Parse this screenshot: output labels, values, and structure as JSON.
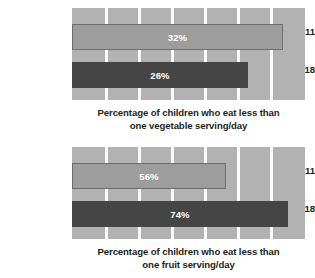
{
  "chart_data": [
    {
      "type": "bar",
      "orientation": "horizontal",
      "title": "",
      "caption_line1": "Percentage of children who eat less than",
      "caption_line2": "one vegetable serving/day",
      "xlabel": "",
      "ylabel": "",
      "categories": [
        "Ages 6–11",
        "Ages 12–18"
      ],
      "values": [
        32,
        26
      ],
      "value_labels": [
        "32%",
        "26%"
      ],
      "bar_pixel_widths": [
        211,
        176
      ],
      "bar_styles": [
        "light",
        "dark"
      ],
      "grid": true,
      "gridline_count": 6,
      "legend": "none"
    },
    {
      "type": "bar",
      "orientation": "horizontal",
      "title": "",
      "caption_line1": "Percentage of children who eat less than",
      "caption_line2": "one fruit serving/day",
      "xlabel": "",
      "ylabel": "",
      "categories": [
        "Ages 6–11",
        "Ages 12–18"
      ],
      "values": [
        56,
        74
      ],
      "value_labels": [
        "56%",
        "74%"
      ],
      "bar_pixel_widths": [
        154,
        216
      ],
      "bar_styles": [
        "light",
        "dark"
      ],
      "grid": true,
      "gridline_count": 6,
      "legend": "none"
    }
  ],
  "colors": {
    "plot_background": "#b2b2b2",
    "gridline": "#fbfbfb",
    "bar_light": "#9d9d9d",
    "bar_light_border": "#6e6e6e",
    "bar_dark": "#454545",
    "value_text": "#ffffff",
    "label_text": "#231f20",
    "page_background": "#ffffff"
  },
  "layout": {
    "gridline_offsets": [
      33,
      66,
      99,
      132,
      165,
      198
    ]
  }
}
